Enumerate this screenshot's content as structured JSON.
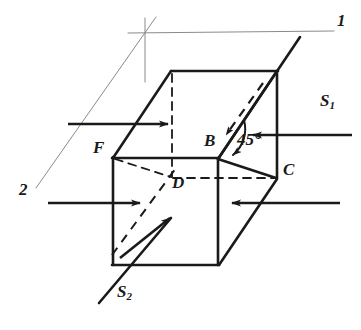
{
  "figure": {
    "type": "line-diagram",
    "background_color": "#ffffff",
    "ink_color": "#1a1a1a",
    "thin_line_color": "#8a8a8a",
    "vertex_labels": [
      {
        "id": "F",
        "text": "F",
        "x": 93,
        "y": 148
      },
      {
        "id": "B",
        "text": "B",
        "x": 205,
        "y": 141
      },
      {
        "id": "C",
        "text": "C",
        "x": 284,
        "y": 170
      },
      {
        "id": "D",
        "text": "D",
        "x": 173,
        "y": 182
      }
    ],
    "plane_labels": [
      {
        "id": "plane-1",
        "text": "1",
        "x": 338,
        "y": 20
      },
      {
        "id": "plane-2",
        "text": "2",
        "x": 20,
        "y": 189
      }
    ],
    "angle_labels": [
      {
        "id": "angle-45",
        "text": "45°",
        "x": 238,
        "y": 139
      }
    ],
    "source_labels": [
      {
        "id": "S1",
        "text": "S",
        "sub": "1",
        "x": 321,
        "y": 100
      },
      {
        "id": "S2",
        "text": "S",
        "sub": "2",
        "x": 118,
        "y": 291
      }
    ]
  },
  "geometry": {
    "cube": {
      "front_top_left": [
        113,
        158
      ],
      "front_top_right": [
        218,
        158
      ],
      "front_bot_left": [
        113,
        265
      ],
      "front_bot_right": [
        218,
        265
      ],
      "back_top_left": [
        172,
        72
      ],
      "back_top_right": [
        277,
        72
      ],
      "back_bot_right": [
        277,
        178
      ],
      "back_bot_left": [
        172,
        178
      ]
    },
    "cut_plane_trace": [
      [
        218,
        158
      ],
      [
        277,
        178
      ]
    ],
    "angle_deg": 45
  }
}
